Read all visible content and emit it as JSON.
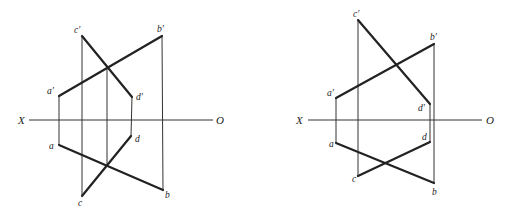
{
  "diagrams": [
    {
      "id": "left",
      "axis": {
        "start_label": "X",
        "end_label": "O",
        "x1": 29,
        "x2": 213,
        "y": 120,
        "start_label_pos": [
          18,
          124
        ],
        "end_label_pos": [
          216,
          124
        ]
      },
      "points": {
        "a_prime": {
          "label": "a′",
          "x": 59,
          "y": 96,
          "lx": 47,
          "ly": 94
        },
        "b_prime": {
          "label": "b′",
          "x": 162,
          "y": 36,
          "lx": 158,
          "ly": 32
        },
        "c_prime": {
          "label": "c′",
          "x": 82,
          "y": 36,
          "lx": 73,
          "ly": 33
        },
        "d_prime": {
          "label": "d′",
          "x": 132,
          "y": 97,
          "lx": 136,
          "ly": 100
        },
        "a": {
          "label": "a",
          "x": 59,
          "y": 145,
          "lx": 49,
          "ly": 149
        },
        "b": {
          "label": "b",
          "x": 163,
          "y": 190,
          "lx": 165,
          "ly": 198
        },
        "c": {
          "label": "c",
          "x": 82,
          "y": 196,
          "lx": 77,
          "ly": 206
        },
        "d": {
          "label": "d",
          "x": 131,
          "y": 136,
          "lx": 135,
          "ly": 142
        }
      },
      "extra_projector_x": 107
    },
    {
      "id": "right",
      "axis": {
        "start_label": "X",
        "end_label": "O",
        "x1": 308,
        "x2": 482,
        "y": 120,
        "start_label_pos": [
          296,
          124
        ],
        "end_label_pos": [
          486,
          124
        ]
      },
      "points": {
        "a_prime": {
          "label": "a′",
          "x": 336,
          "y": 98,
          "lx": 327,
          "ly": 96
        },
        "b_prime": {
          "label": "b′",
          "x": 434,
          "y": 44,
          "lx": 430,
          "ly": 40
        },
        "c_prime": {
          "label": "c′",
          "x": 358,
          "y": 20,
          "lx": 353,
          "ly": 17
        },
        "d_prime": {
          "label": "d′",
          "x": 430,
          "y": 104,
          "lx": 418,
          "ly": 111
        },
        "a": {
          "label": "a",
          "x": 336,
          "y": 143,
          "lx": 329,
          "ly": 147
        },
        "b": {
          "label": "b",
          "x": 434,
          "y": 183,
          "lx": 432,
          "ly": 195
        },
        "c": {
          "label": "c",
          "x": 358,
          "y": 176,
          "lx": 352,
          "ly": 182
        },
        "d": {
          "label": "d",
          "x": 430,
          "y": 142,
          "lx": 422,
          "ly": 140
        }
      }
    }
  ]
}
